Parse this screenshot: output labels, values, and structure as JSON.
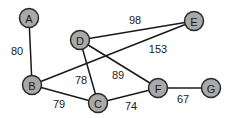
{
  "graph": {
    "node_fill": "#a9a9a9",
    "node_stroke": "#2a2a2a",
    "edge_color": "#1a1a1a",
    "nodes": [
      {
        "id": "A",
        "label": "A",
        "x": 29,
        "y": 18
      },
      {
        "id": "D",
        "label": "D",
        "x": 80,
        "y": 40
      },
      {
        "id": "E",
        "label": "E",
        "x": 194,
        "y": 21
      },
      {
        "id": "B",
        "label": "B",
        "x": 32,
        "y": 85
      },
      {
        "id": "C",
        "label": "C",
        "x": 98,
        "y": 103
      },
      {
        "id": "F",
        "label": "F",
        "x": 158,
        "y": 88
      },
      {
        "id": "G",
        "label": "G",
        "x": 211,
        "y": 88
      }
    ],
    "edges": [
      {
        "from": "A",
        "to": "B",
        "weight": "80",
        "lx": 17,
        "ly": 51
      },
      {
        "from": "D",
        "to": "E",
        "weight": "98",
        "lx": 135,
        "ly": 20
      },
      {
        "from": "B",
        "to": "E",
        "weight": "153",
        "lx": 158,
        "ly": 49
      },
      {
        "from": "D",
        "to": "C",
        "weight": "78",
        "lx": 81,
        "ly": 80
      },
      {
        "from": "D",
        "to": "F",
        "weight": "89",
        "lx": 118,
        "ly": 75
      },
      {
        "from": "B",
        "to": "C",
        "weight": "79",
        "lx": 59,
        "ly": 104
      },
      {
        "from": "C",
        "to": "F",
        "weight": "74",
        "lx": 131,
        "ly": 106
      },
      {
        "from": "F",
        "to": "G",
        "weight": "67",
        "lx": 183,
        "ly": 99
      }
    ]
  }
}
